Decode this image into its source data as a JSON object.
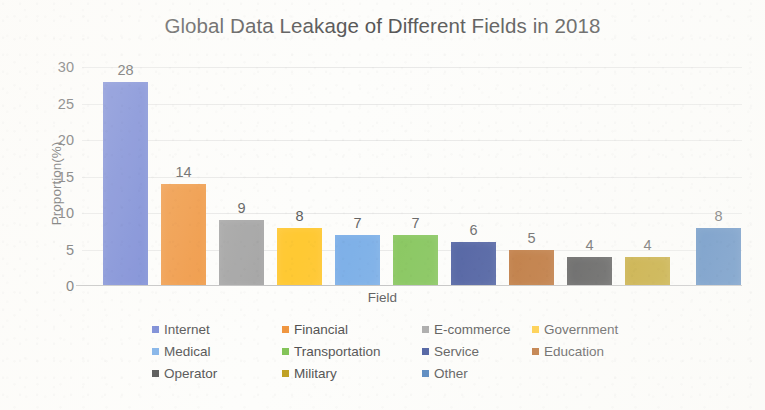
{
  "chart_data": {
    "type": "bar",
    "title": "Global Data Leakage of Different Fields in 2018",
    "xlabel": "Field",
    "ylabel": "Proportion(%)",
    "categories": [
      "Internet",
      "Financial",
      "E-commerce",
      "Government",
      "Medical",
      "Transportation",
      "Service",
      "Education",
      "Operator",
      "Military",
      "Other"
    ],
    "values": [
      28,
      14,
      9,
      8,
      7,
      7,
      6,
      5,
      4,
      4,
      8
    ],
    "colors": [
      "#7183d4",
      "#f0963f",
      "#a5a5a5",
      "#ffc933",
      "#7aaee8",
      "#82c457",
      "#41549b",
      "#b86a2a",
      "#4b4b4b",
      "#bfa020",
      "#4a7ebb"
    ],
    "ylim": [
      0,
      30
    ],
    "yticks": [
      30,
      25,
      20,
      15,
      10,
      5,
      0
    ],
    "ytick_labels": [
      "30",
      "25",
      "20",
      "15",
      "10",
      "5",
      "0"
    ],
    "grid": true,
    "legend_position": "bottom",
    "legend_columns": 4,
    "data_labels": [
      "28",
      "14",
      "9",
      "8",
      "7",
      "7",
      "6",
      "5",
      "4",
      "4",
      "8"
    ]
  },
  "legend": {
    "items": [
      {
        "label": "Internet",
        "color": "#7183d4"
      },
      {
        "label": "Financial",
        "color": "#f0963f"
      },
      {
        "label": "E-commerce",
        "color": "#a5a5a5"
      },
      {
        "label": "Government",
        "color": "#ffc933"
      },
      {
        "label": "Medical",
        "color": "#7aaee8"
      },
      {
        "label": "Transportation",
        "color": "#82c457"
      },
      {
        "label": "Service",
        "color": "#41549b"
      },
      {
        "label": "Education",
        "color": "#b86a2a"
      },
      {
        "label": "Operator",
        "color": "#4b4b4b"
      },
      {
        "label": "Military",
        "color": "#bfa020"
      },
      {
        "label": "Other",
        "color": "#4a7ebb"
      }
    ]
  }
}
